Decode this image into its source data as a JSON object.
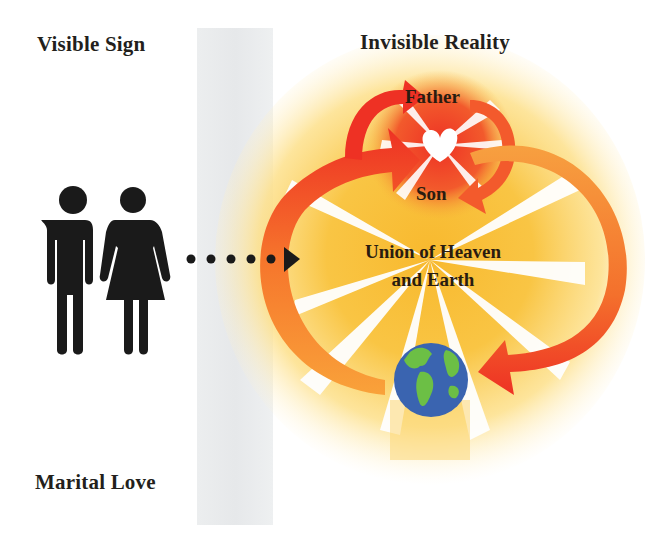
{
  "diagram": {
    "left_column": {
      "heading": "Visible Sign",
      "footer": "Marital Love",
      "pictogram": "man-and-woman-icon"
    },
    "right_column": {
      "heading": "Invisible Reality",
      "nodes": {
        "top": "Father",
        "middle": "Son",
        "center_line1": "Union of Heaven",
        "center_line2": "and Earth",
        "bottom": "earth-globe-icon"
      },
      "spirit_symbol": "dove-heart-icon"
    },
    "connector": {
      "style": "dotted-arrow",
      "direction": "left-to-right",
      "dot_count": 5
    },
    "colors": {
      "text": "#231f1c",
      "band": "#e8eaeb",
      "sun_yellow": "#f7c23a",
      "sun_orange": "#f59a2a",
      "arrow_red": "#ee3124",
      "arrow_orange": "#f68b2c",
      "globe_ocean": "#3a64b0",
      "globe_land": "#6cbf45"
    }
  }
}
